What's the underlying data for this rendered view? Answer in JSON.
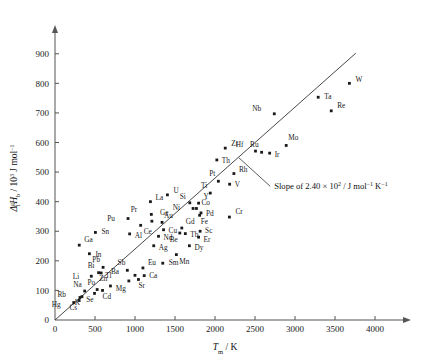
{
  "chart_data": {
    "type": "scatter",
    "title": "",
    "xlabel": "T_m / K",
    "ylabel": "Δ₁ᵍH_b / 10³ J mol⁻¹",
    "xlabel_parts": {
      "italic": "T",
      "sub": "m",
      "rest": " / K"
    },
    "ylabel_parts": {
      "delta": "Δ",
      "sup_left": "g",
      "sub_left": "l",
      "italic_h": "H",
      "sub_h": "b",
      "rest": " / 10",
      "exp": "3",
      "units": " J mol",
      "units_exp": "−1"
    },
    "xlim": [
      0,
      4250
    ],
    "ylim": [
      0,
      960
    ],
    "xticks": [
      0,
      500,
      1000,
      1500,
      2000,
      2500,
      3000,
      3500,
      4000
    ],
    "xticklabels": [
      "0",
      "500",
      "1000",
      "1500",
      "2000",
      "2500",
      "3000",
      "3500",
      "4000"
    ],
    "yticks": [
      0,
      100,
      200,
      300,
      400,
      500,
      600,
      700,
      800,
      900
    ],
    "yticklabels": [
      "0",
      "100",
      "200",
      "300",
      "400",
      "500",
      "600",
      "700",
      "800",
      "900"
    ],
    "grid": false,
    "legend": null,
    "marker_color": "#1a1a1a",
    "line_color": "#333333",
    "axis_color": "#555555",
    "trendline": {
      "label": "Slope of 2.40 × 10² / J mol⁻¹ K⁻¹",
      "slope_value": 240,
      "slope_mantissa": "2.40",
      "slope_exponent": "2",
      "slope_units": "J mol⁻¹ K⁻¹",
      "x_start": 0,
      "y_start": 0,
      "x_end": 3760,
      "y_end": 902
    },
    "annotation": {
      "text_prefix": "Slope of ",
      "mantissa": "2.40",
      "times": " × 10",
      "exponent": "2",
      "suffix": " / J mol",
      "exp1": "−1",
      "kelvin": " K",
      "exp2": "−1",
      "leader_from": [
        2300,
        548
      ],
      "leader_to": [
        2690,
        452
      ]
    },
    "points": [
      {
        "el": "Hg",
        "x": 234,
        "y": 59,
        "lx": -13,
        "ly": 4
      },
      {
        "el": "Cs",
        "x": 302,
        "y": 66,
        "lx": -2,
        "ly": 10
      },
      {
        "el": "Rb",
        "x": 312,
        "y": 76,
        "lx": -14,
        "ly": -1
      },
      {
        "el": "K",
        "x": 337,
        "y": 79,
        "lx": -2,
        "ly": 8
      },
      {
        "el": "Na",
        "x": 371,
        "y": 98,
        "lx": -3,
        "ly": -4
      },
      {
        "el": "Se",
        "x": 494,
        "y": 90,
        "lx": -1,
        "ly": 9
      },
      {
        "el": "Po",
        "x": 527,
        "y": 103,
        "lx": -2,
        "ly": -5
      },
      {
        "el": "Cd",
        "x": 594,
        "y": 100,
        "lx": 0,
        "ly": 9
      },
      {
        "el": "Zn",
        "x": 693,
        "y": 115,
        "lx": -3,
        "ly": -5
      },
      {
        "el": "Mg",
        "x": 923,
        "y": 132,
        "lx": -3,
        "ly": 10
      },
      {
        "el": "Ba",
        "x": 1000,
        "y": 151,
        "lx": -16,
        "ly": -1
      },
      {
        "el": "Sr",
        "x": 1043,
        "y": 137,
        "lx": 0,
        "ly": 9
      },
      {
        "el": "Ca",
        "x": 1115,
        "y": 150,
        "lx": 5,
        "ly": 2
      },
      {
        "el": "Li",
        "x": 454,
        "y": 148,
        "lx": -12,
        "ly": 3
      },
      {
        "el": "Bi",
        "x": 545,
        "y": 160,
        "lx": -4,
        "ly": -5
      },
      {
        "el": "Tl",
        "x": 577,
        "y": 159,
        "lx": 4,
        "ly": 5
      },
      {
        "el": "Pb",
        "x": 601,
        "y": 178,
        "lx": -3,
        "ly": -5
      },
      {
        "el": "Sb",
        "x": 904,
        "y": 168,
        "lx": -2,
        "ly": -5
      },
      {
        "el": "Eu",
        "x": 1099,
        "y": 176,
        "lx": 5,
        "ly": -3
      },
      {
        "el": "Sm",
        "x": 1347,
        "y": 192,
        "lx": 6,
        "ly": 2
      },
      {
        "el": "Mn",
        "x": 1517,
        "y": 221,
        "lx": 3,
        "ly": 9
      },
      {
        "el": "In",
        "x": 430,
        "y": 224,
        "lx": 6,
        "ly": 3
      },
      {
        "el": "Ga",
        "x": 303,
        "y": 253,
        "lx": 5,
        "ly": -3
      },
      {
        "el": "Sn",
        "x": 505,
        "y": 296,
        "lx": 6,
        "ly": 2
      },
      {
        "el": "Al",
        "x": 933,
        "y": 291,
        "lx": 5,
        "ly": 4
      },
      {
        "el": "Pu",
        "x": 913,
        "y": 343,
        "lx": -13,
        "ly": 2
      },
      {
        "el": "Ce",
        "x": 1071,
        "y": 320,
        "lx": 3,
        "ly": 9
      },
      {
        "el": "Ag",
        "x": 1234,
        "y": 251,
        "lx": 5,
        "ly": 4
      },
      {
        "el": "Nd",
        "x": 1294,
        "y": 283,
        "lx": 5,
        "ly": 4
      },
      {
        "el": "Be",
        "x": 1560,
        "y": 294,
        "lx": -2,
        "ly": 9
      },
      {
        "el": "Cu",
        "x": 1357,
        "y": 305,
        "lx": 5,
        "ly": 3
      },
      {
        "el": "Gd",
        "x": 1585,
        "y": 311,
        "lx": 4,
        "ly": -4
      },
      {
        "el": "Tb",
        "x": 1629,
        "y": 292,
        "lx": 5,
        "ly": 3
      },
      {
        "el": "Dy",
        "x": 1680,
        "y": 251,
        "lx": 5,
        "ly": 4
      },
      {
        "el": "Er",
        "x": 1795,
        "y": 280,
        "lx": 5,
        "ly": 5
      },
      {
        "el": "Sc",
        "x": 1814,
        "y": 300,
        "lx": 5,
        "ly": 2
      },
      {
        "el": "Au",
        "x": 1338,
        "y": 330,
        "lx": 2,
        "ly": -4
      },
      {
        "el": "Ge",
        "x": 1211,
        "y": 334,
        "lx": 8,
        "ly": -6
      },
      {
        "el": "Pr",
        "x": 1204,
        "y": 357,
        "lx": -14,
        "ly": -2
      },
      {
        "el": "La",
        "x": 1193,
        "y": 400,
        "lx": 5,
        "ly": -2
      },
      {
        "el": "U",
        "x": 1405,
        "y": 423,
        "lx": 6,
        "ly": -2
      },
      {
        "el": "Si",
        "x": 1685,
        "y": 396,
        "lx": -4,
        "ly": -4
      },
      {
        "el": "Y",
        "x": 1795,
        "y": 395,
        "lx": 5,
        "ly": -4
      },
      {
        "el": "Ni",
        "x": 1726,
        "y": 377,
        "lx": -13,
        "ly": 2
      },
      {
        "el": "Co",
        "x": 1768,
        "y": 377,
        "lx": 5,
        "ly": -3
      },
      {
        "el": "Pd",
        "x": 1825,
        "y": 362,
        "lx": 5,
        "ly": 3
      },
      {
        "el": "Fe",
        "x": 1808,
        "y": 354,
        "lx": 1,
        "ly": 9
      },
      {
        "el": "Cr",
        "x": 2180,
        "y": 348,
        "lx": 6,
        "ly": -3
      },
      {
        "el": "Ti",
        "x": 1941,
        "y": 429,
        "lx": -3,
        "ly": -5
      },
      {
        "el": "Pt",
        "x": 2042,
        "y": 469,
        "lx": -3,
        "ly": -5
      },
      {
        "el": "V",
        "x": 2183,
        "y": 459,
        "lx": 5,
        "ly": 3
      },
      {
        "el": "Rh",
        "x": 2236,
        "y": 495,
        "lx": 5,
        "ly": -2
      },
      {
        "el": "Th",
        "x": 2023,
        "y": 541,
        "lx": 5,
        "ly": 3
      },
      {
        "el": "Zr",
        "x": 2128,
        "y": 581,
        "lx": 6,
        "ly": -2
      },
      {
        "el": "Hf",
        "x": 2506,
        "y": 571,
        "lx": -12,
        "ly": -4
      },
      {
        "el": "Ru",
        "x": 2583,
        "y": 567,
        "lx": -3,
        "ly": -5
      },
      {
        "el": "Ir",
        "x": 2683,
        "y": 564,
        "lx": 5,
        "ly": 4
      },
      {
        "el": "Mo",
        "x": 2890,
        "y": 590,
        "lx": 2,
        "ly": -5
      },
      {
        "el": "Nb",
        "x": 2741,
        "y": 697,
        "lx": -13,
        "ly": -3
      },
      {
        "el": "Ta",
        "x": 3290,
        "y": 753,
        "lx": 6,
        "ly": 2
      },
      {
        "el": "Re",
        "x": 3453,
        "y": 707,
        "lx": 6,
        "ly": -3
      },
      {
        "el": "W",
        "x": 3680,
        "y": 800,
        "lx": 6,
        "ly": -1
      }
    ]
  },
  "axes": {
    "y_axis_name": "vaporization-enthalpy-axis",
    "x_axis_name": "melting-temperature-axis"
  }
}
